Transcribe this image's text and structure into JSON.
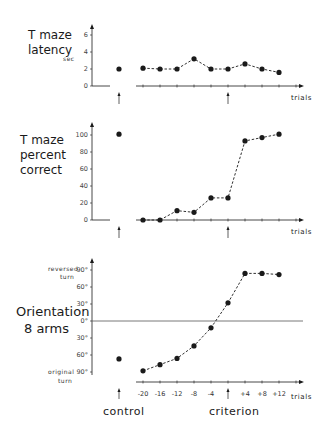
{
  "chart_data": [
    {
      "type": "line",
      "title": "T maze latency",
      "ylabel": "sec",
      "xlabel": "trials",
      "ylim": [
        0,
        7
      ],
      "yticks": [
        0,
        2,
        4,
        6
      ],
      "control": {
        "label": "control",
        "value": 2
      },
      "x": [
        -20,
        -16,
        -12,
        -8,
        -4,
        0,
        4,
        8,
        12
      ],
      "values": [
        2.1,
        2.0,
        2.0,
        3.2,
        2.0,
        2.0,
        2.6,
        2.0,
        1.6
      ],
      "criterion_x": 0
    },
    {
      "type": "line",
      "title": "T maze percent correct",
      "ylabel": "",
      "xlabel": "trials",
      "ylim": [
        0,
        120
      ],
      "yticks": [
        0,
        20,
        40,
        60,
        80,
        100
      ],
      "control": {
        "label": "control",
        "value": 101
      },
      "x": [
        -20,
        -16,
        -12,
        -8,
        -4,
        0,
        4,
        8,
        12
      ],
      "values": [
        0,
        0,
        11,
        9,
        26,
        26,
        93,
        97,
        101
      ],
      "criterion_x": 0
    },
    {
      "type": "line",
      "title": "Orientation 8 arms",
      "ylabel_top": "reversed turn",
      "ylabel_bottom": "original turn",
      "xlabel": "trials",
      "ylim": [
        -90,
        90
      ],
      "yticks": [
        "90°",
        "60°",
        "30°",
        "0°",
        "30°",
        "60°",
        "90°"
      ],
      "control": {
        "label": "control",
        "value": -67
      },
      "x": [
        -20,
        -16,
        -12,
        -8,
        -4,
        0,
        4,
        8,
        12
      ],
      "xticklabels": [
        "-20",
        "-16",
        "-12",
        "-8",
        "-4",
        "",
        "+4",
        "+8",
        "+12"
      ],
      "values": [
        -88,
        -77,
        -66,
        -44,
        -12,
        32,
        84,
        84,
        82
      ],
      "criterion_x": 0
    }
  ],
  "labels": {
    "latency_title_1": "T maze",
    "latency_title_2": "latency",
    "latency_unit": "sec",
    "percent_title_1": "T maze",
    "percent_title_2": "percent",
    "percent_title_3": "correct",
    "orient_title_1": "Orientation",
    "orient_title_2": "8 arms",
    "reversed_1": "reversed",
    "reversed_2": "turn",
    "original_1": "original",
    "original_2": "turn",
    "trials": "trials",
    "control": "control",
    "criterion": "criterion"
  },
  "ticks": {
    "lat": [
      "0",
      "2",
      "4",
      "6"
    ],
    "pct": [
      "0",
      "20",
      "40",
      "60",
      "80",
      "100"
    ],
    "ori": [
      "90°",
      "60°",
      "30°",
      "0°",
      "30°",
      "60°",
      "90°"
    ],
    "x": [
      "-20",
      "-16",
      "-12",
      "-8",
      "-4",
      "+4",
      "+8",
      "+12"
    ]
  }
}
